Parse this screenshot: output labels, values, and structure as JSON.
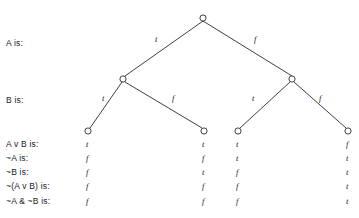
{
  "diagram": {
    "type": "truth-tree",
    "levels": [
      {
        "name": "A",
        "label": "A is:"
      },
      {
        "name": "B",
        "label": "B is:"
      }
    ],
    "edge_labels": {
      "level_a": [
        "t",
        "f"
      ],
      "level_b": [
        "t",
        "f",
        "t",
        "f"
      ]
    },
    "columns": [
      "tt",
      "tf",
      "ft",
      "ff"
    ],
    "rows": [
      {
        "label": "A v B is:",
        "values": [
          "t",
          "t",
          "t",
          "f"
        ]
      },
      {
        "label": "~A is:",
        "values": [
          "f",
          "f",
          "t",
          "t"
        ]
      },
      {
        "label": "~B is:",
        "values": [
          "f",
          "t",
          "f",
          "t"
        ]
      },
      {
        "label": "~(A v B) is:",
        "values": [
          "f",
          "f",
          "f",
          "t"
        ]
      },
      {
        "label": "~A & ~B is:",
        "values": [
          "f",
          "f",
          "f",
          "t"
        ]
      }
    ],
    "colors": {
      "ink": "#1a1a1a",
      "line": "#2a2a2a",
      "background": "#ffffff"
    }
  }
}
